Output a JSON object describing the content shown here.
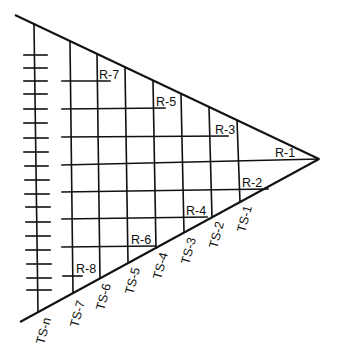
{
  "diagram": {
    "type": "triangular-grid",
    "colors": {
      "line": "#111111",
      "background": "#ffffff"
    },
    "spine": {
      "label": "TS-n",
      "tick_count": 18
    },
    "columns": [
      {
        "id": "TS-7",
        "label": "TS-7"
      },
      {
        "id": "TS-6",
        "label": "TS-6"
      },
      {
        "id": "TS-5",
        "label": "TS-5"
      },
      {
        "id": "TS-4",
        "label": "TS-4"
      },
      {
        "id": "TS-3",
        "label": "TS-3"
      },
      {
        "id": "TS-2",
        "label": "TS-2"
      },
      {
        "id": "TS-1",
        "label": "TS-1"
      }
    ],
    "rows": [
      {
        "id": "R-7",
        "label": "R-7"
      },
      {
        "id": "R-5",
        "label": "R-5"
      },
      {
        "id": "R-3",
        "label": "R-3"
      },
      {
        "id": "R-1",
        "label": "R-1"
      },
      {
        "id": "R-2",
        "label": "R-2"
      },
      {
        "id": "R-4",
        "label": "R-4"
      },
      {
        "id": "R-6",
        "label": "R-6"
      },
      {
        "id": "R-8",
        "label": "R-8"
      }
    ]
  }
}
